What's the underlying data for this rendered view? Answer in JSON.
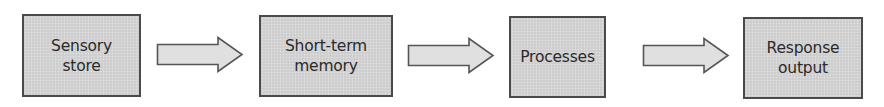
{
  "diagram": {
    "type": "flowchart",
    "direction": "left-to-right",
    "colors": {
      "box_fill": "#d2d2d2",
      "box_border": "#4a4a4a",
      "arrow_fill": "#e0e0e0",
      "arrow_stroke": "#555555",
      "text": "#2a2a2a",
      "background": "#ffffff"
    },
    "nodes": [
      {
        "id": "sensory-store",
        "label": "Sensory\nstore"
      },
      {
        "id": "short-term-memory",
        "label": "Short-term\nmemory"
      },
      {
        "id": "processes",
        "label": "Processes"
      },
      {
        "id": "response-output",
        "label": "Response\noutput"
      }
    ],
    "edges": [
      {
        "from": "sensory-store",
        "to": "short-term-memory",
        "style": "block-arrow"
      },
      {
        "from": "short-term-memory",
        "to": "processes",
        "style": "block-arrow"
      },
      {
        "from": "processes",
        "to": "response-output",
        "style": "block-arrow"
      }
    ]
  }
}
